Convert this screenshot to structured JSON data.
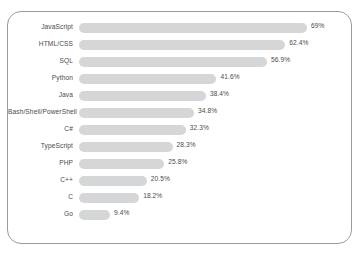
{
  "chart_data": {
    "type": "bar",
    "orientation": "horizontal",
    "title": "",
    "subtitle": "",
    "xlabel": "",
    "ylabel": "",
    "grid": false,
    "legend": null,
    "xlim": [
      0,
      69
    ],
    "value_suffix": "%",
    "bar_color": "#d4d6d8",
    "label_color": "#4a4a4a",
    "card_border_color": "#9a9a9a",
    "background_color": "#ffffff",
    "categories": [
      "JavaScript",
      "HTML/CSS",
      "SQL",
      "Python",
      "Java",
      "Bash/Shell/PowerShell",
      "C#",
      "TypeScript",
      "PHP",
      "C++",
      "C",
      "Go"
    ],
    "values": [
      69,
      62.4,
      56.9,
      41.6,
      38.4,
      34.8,
      32.3,
      28.3,
      25.8,
      20.5,
      18.2,
      9.4
    ],
    "value_labels": [
      "69%",
      "62.4%",
      "56.9%",
      "41.6%",
      "38.4%",
      "34.8%",
      "32.3%",
      "28.3%",
      "25.8%",
      "20.5%",
      "18.2%",
      "9.4%"
    ]
  }
}
